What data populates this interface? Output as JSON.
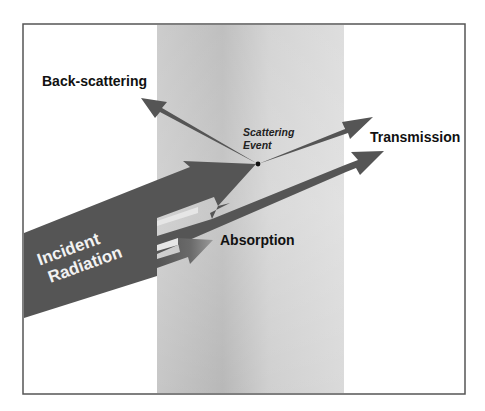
{
  "diagram": {
    "labels": {
      "back_scattering": "Back-scattering",
      "scattering_event_line1": "Scattering",
      "scattering_event_line2": "Event",
      "transmission": "Transmission",
      "absorption": "Absorption",
      "incident_line1": "Incident",
      "incident_line2": "Radiation"
    },
    "colors": {
      "arrow": "#555555",
      "slab_light": "#dcdcdc",
      "slab_dark": "#b9b9b9",
      "frame": "#555555",
      "background": "#ffffff",
      "incident_text": "#f2f2f2"
    },
    "elements": [
      "frame",
      "material-slab",
      "incident-radiation-arrow",
      "scattered-arrow-to-event",
      "back-scattering-arrow",
      "forward-scatter-arrow",
      "transmission-arrow",
      "absorption-arrow",
      "scattering-event-dot"
    ]
  }
}
